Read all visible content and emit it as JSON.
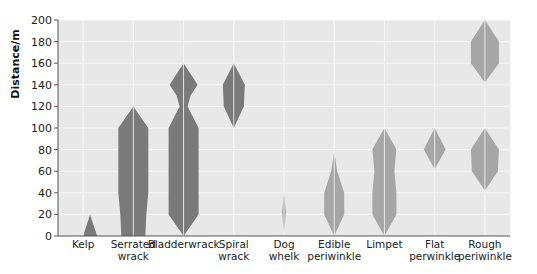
{
  "chart_data": {
    "type": "kite diagram",
    "title": "",
    "xlabel": "",
    "ylabel": "Distance/m",
    "ylim": [
      0,
      200
    ],
    "yticks": [
      0,
      20,
      40,
      60,
      80,
      100,
      120,
      140,
      160,
      180,
      200
    ],
    "grid": true,
    "colors": {
      "dark": "#7a7a7a",
      "light": "#a6a6a6",
      "plot_bg": "#e8e8e8",
      "grid": "#f8f8f8"
    },
    "categories": [
      {
        "label": [
          "Kelp"
        ],
        "shade": "dark",
        "kites": [
          [
            [
              0,
              0
            ],
            [
              20,
              7
            ],
            [
              0,
              14
            ]
          ]
        ]
      },
      {
        "label": [
          "Serrated",
          "wrack"
        ],
        "shade": "dark",
        "kites": [
          [
            [
              0,
              -12
            ],
            [
              20,
              -13
            ],
            [
              40,
              -15
            ],
            [
              100,
              -15
            ],
            [
              120,
              0
            ],
            [
              100,
              15
            ],
            [
              40,
              15
            ],
            [
              20,
              13
            ],
            [
              0,
              12
            ]
          ]
        ]
      },
      {
        "label": [
          "Bladderwrack"
        ],
        "shade": "dark",
        "kites": [
          [
            [
              0,
              0
            ],
            [
              20,
              -15
            ],
            [
              100,
              -15
            ],
            [
              120,
              -4
            ],
            [
              130,
              -7
            ],
            [
              140,
              -14
            ],
            [
              160,
              0
            ],
            [
              140,
              14
            ],
            [
              130,
              7
            ],
            [
              120,
              4
            ],
            [
              100,
              15
            ],
            [
              20,
              15
            ],
            [
              0,
              0
            ]
          ]
        ]
      },
      {
        "label": [
          "Spiral",
          "wrack"
        ],
        "shade": "dark",
        "kites": [
          [
            [
              100,
              0
            ],
            [
              120,
              -10
            ],
            [
              140,
              -11
            ],
            [
              160,
              0
            ],
            [
              140,
              11
            ],
            [
              120,
              10
            ],
            [
              100,
              0
            ]
          ]
        ]
      },
      {
        "label": [
          "Dog",
          "whelk"
        ],
        "shade": "light",
        "kites": [
          [
            [
              3,
              0
            ],
            [
              22,
              2
            ],
            [
              40,
              0
            ],
            [
              22,
              -2
            ]
          ]
        ]
      },
      {
        "label": [
          "Edible",
          "periwinkle"
        ],
        "shade": "light",
        "kites": [
          [
            [
              0,
              0
            ],
            [
              20,
              -10
            ],
            [
              40,
              -10
            ],
            [
              60,
              -3
            ],
            [
              78,
              0
            ],
            [
              60,
              3
            ],
            [
              40,
              10
            ],
            [
              20,
              10
            ]
          ]
        ]
      },
      {
        "label": [
          "Limpet"
        ],
        "shade": "light",
        "kites": [
          [
            [
              0,
              0
            ],
            [
              20,
              -12
            ],
            [
              40,
              -12
            ],
            [
              60,
              -10
            ],
            [
              80,
              -12
            ],
            [
              100,
              0
            ],
            [
              80,
              12
            ],
            [
              60,
              10
            ],
            [
              40,
              12
            ],
            [
              20,
              12
            ]
          ]
        ]
      },
      {
        "label": [
          "Flat",
          "perwinkle"
        ],
        "shade": "light",
        "kites": [
          [
            [
              62,
              0
            ],
            [
              80,
              -11
            ],
            [
              100,
              0
            ],
            [
              80,
              11
            ]
          ]
        ]
      },
      {
        "label": [
          "Rough",
          "periwinkle"
        ],
        "shade": "light",
        "kites": [
          [
            [
              42,
              0
            ],
            [
              60,
              -13
            ],
            [
              80,
              -14
            ],
            [
              100,
              0
            ],
            [
              80,
              14
            ],
            [
              60,
              13
            ]
          ],
          [
            [
              142,
              0
            ],
            [
              160,
              -14
            ],
            [
              180,
              -14
            ],
            [
              200,
              0
            ],
            [
              180,
              14
            ],
            [
              160,
              14
            ]
          ]
        ]
      }
    ],
    "note": "Each kite's width is symmetric around the category centre line; second number in each point is half-width offset in px-ish units"
  }
}
